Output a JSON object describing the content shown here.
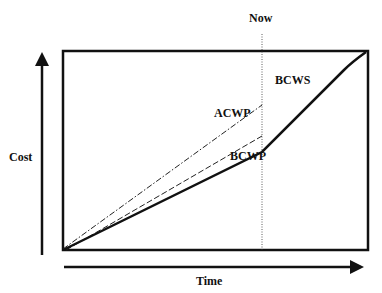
{
  "diagram": {
    "labels": {
      "now": "Now",
      "cost": "Cost",
      "time": "Time",
      "bcws": "BCWS",
      "acwp": "ACWP",
      "bcwp": "BCWP"
    },
    "series": [
      {
        "name": "BCWS",
        "style": "solid-thick",
        "points": [
          [
            0,
            0
          ],
          [
            0.65,
            0.49
          ],
          [
            0.92,
            0.91
          ],
          [
            1,
            1
          ]
        ]
      },
      {
        "name": "ACWP",
        "style": "dash-dot",
        "points": [
          [
            0,
            0
          ],
          [
            0.65,
            0.73
          ]
        ]
      },
      {
        "name": "BCWP",
        "style": "dashed",
        "points": [
          [
            0,
            0
          ],
          [
            0.65,
            0.57
          ]
        ]
      }
    ],
    "now_marker_x": 0.65,
    "colors": {
      "line": "#111111",
      "background": "#ffffff"
    }
  }
}
